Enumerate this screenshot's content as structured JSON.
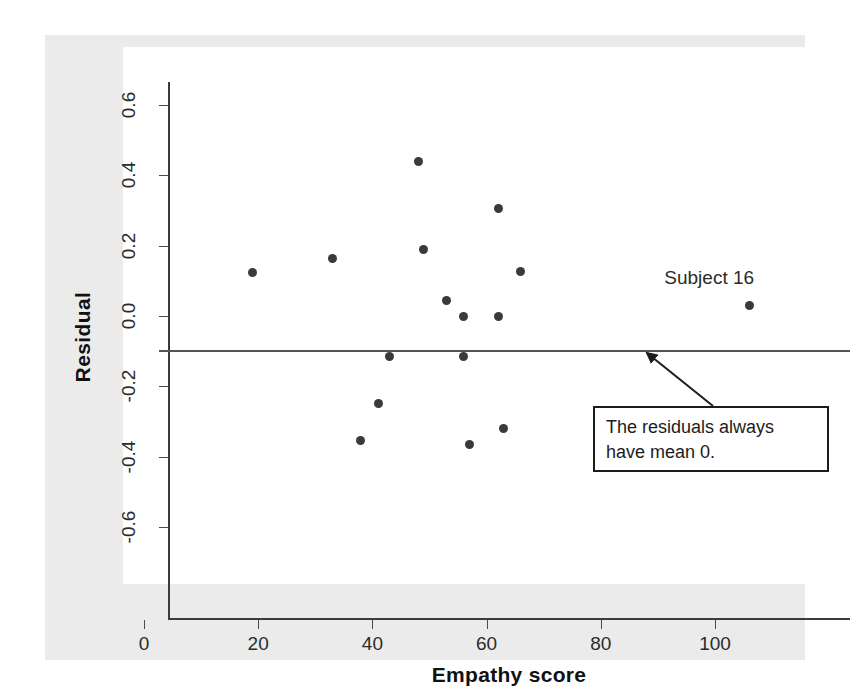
{
  "chart_data": {
    "type": "scatter",
    "title": "",
    "xlabel": "Empathy score",
    "ylabel": "Residual",
    "xlim": [
      -5,
      116
    ],
    "ylim": [
      -0.72,
      0.72
    ],
    "grid": false,
    "legend": null,
    "xticks": [
      0,
      20,
      40,
      60,
      80,
      100
    ],
    "xtick_labels": [
      "0",
      "20",
      "40",
      "60",
      "80",
      "100"
    ],
    "yticks": [
      0.6,
      0.4,
      0.2,
      0.0,
      -0.2,
      -0.4,
      -0.6
    ],
    "ytick_labels": [
      "0.6",
      "0.4",
      "0.2",
      "0.0",
      "-0.2",
      "-0.4",
      "-0.6"
    ],
    "reference_line": {
      "y": 0.0,
      "orientation": "horizontal"
    },
    "points": [
      {
        "x": 19,
        "y": 0.125
      },
      {
        "x": 33,
        "y": 0.165
      },
      {
        "x": 38,
        "y": -0.355
      },
      {
        "x": 41,
        "y": -0.25
      },
      {
        "x": 43,
        "y": -0.115
      },
      {
        "x": 48,
        "y": 0.44
      },
      {
        "x": 49,
        "y": 0.19
      },
      {
        "x": 53,
        "y": 0.045
      },
      {
        "x": 56,
        "y": 0.0
      },
      {
        "x": 56,
        "y": -0.115
      },
      {
        "x": 57,
        "y": -0.365
      },
      {
        "x": 62,
        "y": 0.0
      },
      {
        "x": 62,
        "y": 0.305
      },
      {
        "x": 63,
        "y": -0.32
      },
      {
        "x": 66,
        "y": 0.128
      },
      {
        "x": 106,
        "y": 0.03
      }
    ],
    "annotations": [
      {
        "name": "subject-16-label",
        "text": "Subject 16",
        "x": 99,
        "y": 0.105
      },
      {
        "name": "mean-zero-callout",
        "lines": [
          "The residuals always",
          "have mean 0."
        ],
        "points_to": {
          "x": 83,
          "y": 0.0
        }
      }
    ]
  },
  "colors": {
    "page_background": "#ffffff",
    "figure_background": "#ebebeb",
    "plot_background": "#ffffff",
    "axis": "#3b3b3b",
    "point": "#3a3a3a",
    "reference_line": "#555555",
    "text": "#1c1c1c"
  }
}
